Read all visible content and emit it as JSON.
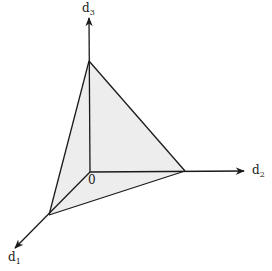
{
  "diagram": {
    "title": "",
    "colors": {
      "stroke": "#1a1a1a",
      "fill": "#ededed",
      "background": "#ffffff"
    },
    "origin": {
      "label": "0",
      "x": 90,
      "y": 172
    },
    "axes": [
      {
        "name": "d",
        "subscript": "1",
        "from": [
          90,
          172
        ],
        "to": [
          15,
          248
        ],
        "label_pos": [
          8,
          262
        ]
      },
      {
        "name": "d",
        "subscript": "2",
        "from": [
          90,
          172
        ],
        "to": [
          244,
          171
        ],
        "label_pos": [
          252,
          174
        ]
      },
      {
        "name": "d",
        "subscript": "3",
        "from": [
          90,
          172
        ],
        "to": [
          89,
          18
        ],
        "label_pos": [
          82,
          14
        ]
      }
    ],
    "vertices": {
      "d1_intercept": [
        49,
        215
      ],
      "d2_intercept": [
        185,
        171
      ],
      "d3_intercept": [
        89,
        61
      ]
    },
    "face": "shaded simplex triangle connecting the three axis intercepts"
  }
}
